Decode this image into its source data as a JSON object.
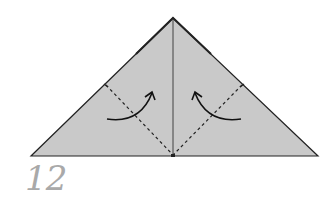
{
  "step": {
    "number": "12"
  },
  "colors": {
    "paper_fill": "#c9c9c9",
    "edge": "#222222",
    "step_number": "#a9a9a9",
    "background": "#ffffff"
  },
  "diagram": {
    "shape": "triangle",
    "vertices": {
      "apex": [
        173,
        18
      ],
      "left": [
        31,
        156
      ],
      "right": [
        318,
        156
      ]
    },
    "center_crease": {
      "from": [
        173,
        18
      ],
      "to": [
        173,
        156
      ]
    },
    "valley_folds": [
      {
        "from": [
          106,
          85
        ],
        "to": [
          173,
          155
        ]
      },
      {
        "from": [
          242,
          85
        ],
        "to": [
          173,
          155
        ]
      }
    ],
    "arrows": [
      {
        "direction": "up-right",
        "path": "M107 119 Q140 124 152 93"
      },
      {
        "direction": "up-left",
        "path": "M241 119 Q207 124 195 93"
      }
    ]
  }
}
